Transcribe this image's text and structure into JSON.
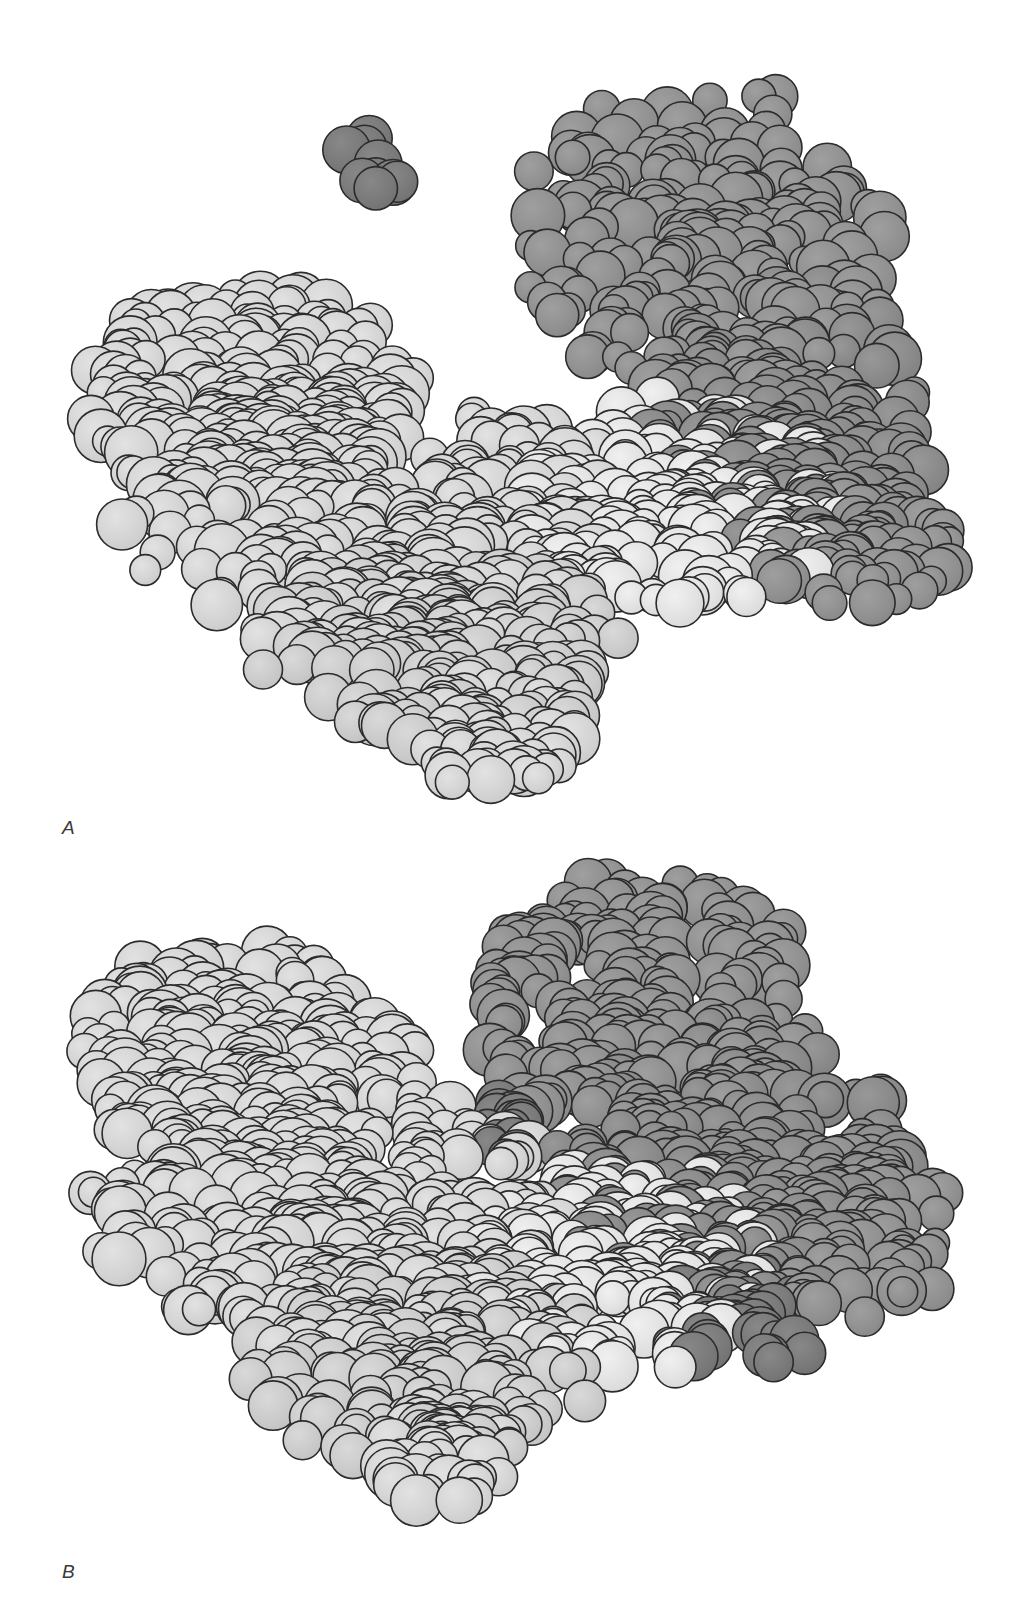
{
  "figure": {
    "width": 1019,
    "height": 1624,
    "background_color": "#ffffff",
    "kind": "space-filling-molecular-model"
  },
  "palette": {
    "light_domain_fill": "#d4d4d4",
    "light_domain_fill_alt": "#cbcbcb",
    "light_domain_highlight": "#e2e2e2",
    "dark_domain_fill": "#919191",
    "dark_domain_fill_alt": "#8a8a8a",
    "dark_domain_deep": "#7a7a7a",
    "outline_color": "#2b2b2b",
    "outline_width": 1.6,
    "background": "#ffffff"
  },
  "panels": [
    {
      "id": "panel-a",
      "label": "A",
      "label_x": 62,
      "label_y": 818,
      "top": 0,
      "height": 840,
      "caption_state": "open conformation",
      "groups": [
        {
          "name": "ligand-cluster",
          "shade": "dark_domain_deep",
          "atom_count": 9,
          "center_x": 377,
          "center_y": 165,
          "radius_x": 34,
          "radius_y": 34,
          "sphere_radius_min": 20,
          "sphere_radius_max": 25,
          "seed": 1201
        },
        {
          "name": "dark-domain-upper-lobe",
          "shade": "dark_domain_fill",
          "atom_count": 210,
          "center_x": 700,
          "center_y": 245,
          "radius_x": 185,
          "radius_y": 155,
          "sphere_radius_min": 15,
          "sphere_radius_max": 27,
          "seed": 2048
        },
        {
          "name": "dark-domain-lower-lobe",
          "shade": "dark_domain_fill_alt",
          "atom_count": 180,
          "center_x": 790,
          "center_y": 430,
          "radius_x": 145,
          "radius_y": 140,
          "sphere_radius_min": 15,
          "sphere_radius_max": 27,
          "seed": 3099
        },
        {
          "name": "dark-domain-right-tail",
          "shade": "dark_domain_fill",
          "atom_count": 70,
          "center_x": 855,
          "center_y": 545,
          "radius_x": 95,
          "radius_y": 70,
          "sphere_radius_min": 14,
          "sphere_radius_max": 25,
          "seed": 4177
        },
        {
          "name": "light-domain-upper-left",
          "shade": "light_domain_fill",
          "atom_count": 230,
          "center_x": 250,
          "center_y": 400,
          "radius_x": 170,
          "radius_y": 115,
          "sphere_radius_min": 15,
          "sphere_radius_max": 28,
          "seed": 5231
        },
        {
          "name": "light-domain-core",
          "shade": "light_domain_fill",
          "atom_count": 300,
          "center_x": 380,
          "center_y": 520,
          "radius_x": 245,
          "radius_y": 135,
          "sphere_radius_min": 15,
          "sphere_radius_max": 28,
          "seed": 6340
        },
        {
          "name": "light-domain-right-arm",
          "shade": "light_domain_highlight",
          "atom_count": 170,
          "center_x": 680,
          "center_y": 510,
          "radius_x": 160,
          "radius_y": 105,
          "sphere_radius_min": 15,
          "sphere_radius_max": 27,
          "seed": 7512
        },
        {
          "name": "light-domain-bottom-lobe",
          "shade": "light_domain_fill_alt",
          "atom_count": 190,
          "center_x": 440,
          "center_y": 645,
          "radius_x": 175,
          "radius_y": 100,
          "sphere_radius_min": 15,
          "sphere_radius_max": 27,
          "seed": 8693
        },
        {
          "name": "light-domain-tail",
          "shade": "light_domain_fill",
          "atom_count": 60,
          "center_x": 500,
          "center_y": 735,
          "radius_x": 80,
          "radius_y": 55,
          "sphere_radius_min": 15,
          "sphere_radius_max": 26,
          "seed": 9814
        }
      ]
    },
    {
      "id": "panel-b",
      "label": "B",
      "label_x": 62,
      "label_y": 1562,
      "top": 840,
      "height": 784,
      "caption_state": "closed conformation",
      "groups": [
        {
          "name": "dark-domain-upper-lobe",
          "shade": "dark_domain_fill",
          "atom_count": 215,
          "center_x": 640,
          "center_y": 1010,
          "radius_x": 175,
          "radius_y": 130,
          "sphere_radius_min": 15,
          "sphere_radius_max": 27,
          "seed": 11021
        },
        {
          "name": "dark-domain-core",
          "shade": "dark_domain_fill_alt",
          "atom_count": 230,
          "center_x": 730,
          "center_y": 1165,
          "radius_x": 175,
          "radius_y": 135,
          "sphere_radius_min": 15,
          "sphere_radius_max": 27,
          "seed": 12134
        },
        {
          "name": "dark-domain-right-tail",
          "shade": "dark_domain_fill",
          "atom_count": 85,
          "center_x": 855,
          "center_y": 1235,
          "radius_x": 95,
          "radius_y": 85,
          "sphere_radius_min": 14,
          "sphere_radius_max": 25,
          "seed": 13277
        },
        {
          "name": "dark-domain-interface-patch",
          "shade": "dark_domain_deep",
          "atom_count": 16,
          "center_x": 505,
          "center_y": 1130,
          "radius_x": 30,
          "radius_y": 32,
          "sphere_radius_min": 16,
          "sphere_radius_max": 24,
          "seed": 14388
        },
        {
          "name": "dark-domain-lower-patch",
          "shade": "dark_domain_deep",
          "atom_count": 40,
          "center_x": 735,
          "center_y": 1320,
          "radius_x": 80,
          "radius_y": 55,
          "sphere_radius_min": 15,
          "sphere_radius_max": 25,
          "seed": 15491
        },
        {
          "name": "light-domain-upper-left",
          "shade": "light_domain_fill",
          "atom_count": 245,
          "center_x": 245,
          "center_y": 1065,
          "radius_x": 165,
          "radius_y": 115,
          "sphere_radius_min": 15,
          "sphere_radius_max": 28,
          "seed": 16520
        },
        {
          "name": "light-domain-core",
          "shade": "light_domain_fill",
          "atom_count": 300,
          "center_x": 330,
          "center_y": 1215,
          "radius_x": 230,
          "radius_y": 135,
          "sphere_radius_min": 15,
          "sphere_radius_max": 28,
          "seed": 17648
        },
        {
          "name": "light-domain-right-arm",
          "shade": "light_domain_highlight",
          "atom_count": 165,
          "center_x": 620,
          "center_y": 1270,
          "radius_x": 150,
          "radius_y": 100,
          "sphere_radius_min": 15,
          "sphere_radius_max": 27,
          "seed": 18773
        },
        {
          "name": "light-domain-bottom-lobe",
          "shade": "light_domain_fill_alt",
          "atom_count": 195,
          "center_x": 420,
          "center_y": 1360,
          "radius_x": 180,
          "radius_y": 100,
          "sphere_radius_min": 15,
          "sphere_radius_max": 27,
          "seed": 19881
        },
        {
          "name": "light-domain-tail",
          "shade": "light_domain_fill",
          "atom_count": 55,
          "center_x": 450,
          "center_y": 1455,
          "radius_x": 70,
          "radius_y": 50,
          "sphere_radius_min": 15,
          "sphere_radius_max": 26,
          "seed": 20996
        }
      ]
    }
  ]
}
